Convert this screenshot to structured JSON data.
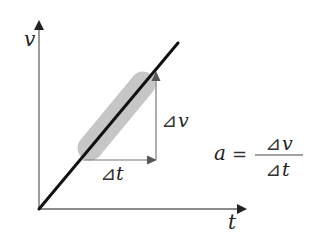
{
  "diagram": {
    "type": "velocity-time graph",
    "axes": {
      "y_label": "v",
      "x_label": "t"
    },
    "line": {
      "description": "straight line of constant slope",
      "color": "#111111"
    },
    "highlight_band": {
      "color": "#c6c6c6"
    },
    "delta_labels": {
      "delta_t": {
        "symbol": "⊿",
        "var": "t"
      },
      "delta_v": {
        "symbol": "⊿",
        "var": "v"
      }
    },
    "formula": {
      "lhs": "a",
      "equals": "=",
      "numerator": {
        "symbol": "⊿",
        "var": "v"
      },
      "denominator": {
        "symbol": "⊿",
        "var": "t"
      }
    },
    "colors": {
      "axis": "#555555",
      "arrow": "#666666",
      "text": "#222222"
    }
  }
}
